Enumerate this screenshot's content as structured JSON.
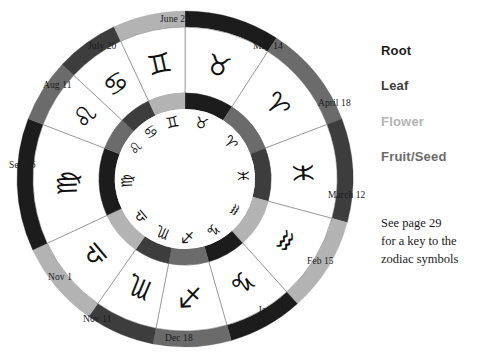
{
  "legend": {
    "items": [
      {
        "label": "Root",
        "color": "#1c1c1c"
      },
      {
        "label": "Leaf",
        "color": "#3d3d3d"
      },
      {
        "label": "Flower",
        "color": "#b3b3b3"
      },
      {
        "label": "Fruit/Seed",
        "color": "#6b6b6b"
      }
    ]
  },
  "note": {
    "line1": "See page 29",
    "line2": "for a key to the",
    "line3": "zodiac symbols"
  },
  "chart_data": {
    "type": "pie",
    "legend_position": "right",
    "grid": false,
    "categories": [
      "Taurus",
      "Aries",
      "Pisces",
      "Aquarius",
      "Capricorn",
      "Sagittarius",
      "Scorpio",
      "Libra",
      "Virgo",
      "Leo",
      "Cancer",
      "Gemini"
    ],
    "values": [
      33,
      36,
      36,
      33,
      26,
      27,
      24,
      30,
      46,
      22,
      22,
      29
    ],
    "segments": [
      {
        "sign": "Taurus",
        "symbol": "♉",
        "element": "Root",
        "color": "#1c1c1c",
        "start_date": "April 18",
        "end_date": "May 14",
        "a0": -90,
        "a1": -57
      },
      {
        "sign": "Aries",
        "symbol": "♈",
        "element": "Fruit/Seed",
        "color": "#6b6b6b",
        "start_date": "March 12",
        "end_date": "April 18",
        "a0": -57,
        "a1": -21
      },
      {
        "sign": "Pisces",
        "symbol": "♓",
        "element": "Leaf",
        "color": "#3d3d3d",
        "start_date": "Feb 15",
        "end_date": "March 12",
        "a0": -21,
        "a1": 15
      },
      {
        "sign": "Aquarius",
        "symbol": "♒",
        "element": "Flower",
        "color": "#b3b3b3",
        "start_date": "Jan 20",
        "end_date": "Feb 15",
        "a0": 15,
        "a1": 48
      },
      {
        "sign": "Capricorn",
        "symbol": "♑",
        "element": "Root",
        "color": "#1c1c1c",
        "start_date": "Dec 18",
        "end_date": "Jan 20",
        "a0": 48,
        "a1": 74
      },
      {
        "sign": "Sagittarius",
        "symbol": "♐",
        "element": "Fruit/Seed",
        "color": "#6b6b6b",
        "start_date": "Nov 11",
        "end_date": "Dec 18",
        "a0": 74,
        "a1": 101
      },
      {
        "sign": "Scorpio",
        "symbol": "♏",
        "element": "Leaf",
        "color": "#3d3d3d",
        "start_date": "Nov 1",
        "end_date": "Nov 11",
        "a0": 101,
        "a1": 125
      },
      {
        "sign": "Libra",
        "symbol": "♎",
        "element": "Flower",
        "color": "#b3b3b3",
        "start_date": "Sep 16",
        "end_date": "Nov 1",
        "a0": 125,
        "a1": 155
      },
      {
        "sign": "Virgo",
        "symbol": "♍",
        "element": "Root",
        "color": "#1c1c1c",
        "start_date": "Aug 11",
        "end_date": "Sep 16",
        "a0": 155,
        "a1": 201
      },
      {
        "sign": "Leo",
        "symbol": "♌",
        "element": "Fruit/Seed",
        "color": "#6b6b6b",
        "start_date": "July 20",
        "end_date": "Aug 11",
        "a0": 201,
        "a1": 223
      },
      {
        "sign": "Cancer",
        "symbol": "♋",
        "element": "Leaf",
        "color": "#3d3d3d",
        "start_date": "June 21",
        "end_date": "July 20",
        "a0": 223,
        "a1": 245
      },
      {
        "sign": "Gemini",
        "symbol": "♊",
        "element": "Flower",
        "color": "#b3b3b3",
        "start_date": "May 14",
        "end_date": "June 21",
        "a0": 245,
        "a1": 270
      }
    ],
    "date_labels": [
      {
        "text": "June 21",
        "x": 160,
        "y": 14
      },
      {
        "text": "May 14",
        "x": 253,
        "y": 41
      },
      {
        "text": "April 18",
        "x": 318,
        "y": 98
      },
      {
        "text": "March 12",
        "x": 328,
        "y": 190
      },
      {
        "text": "Feb 15",
        "x": 307,
        "y": 256
      },
      {
        "text": "Jan 20",
        "x": 258,
        "y": 305
      },
      {
        "text": "Dec 18",
        "x": 165,
        "y": 333
      },
      {
        "text": "Nov 11",
        "x": 83,
        "y": 314
      },
      {
        "text": "Nov 1",
        "x": 48,
        "y": 272
      },
      {
        "text": "Sep 16",
        "x": 9,
        "y": 160
      },
      {
        "text": "Aug 11",
        "x": 43,
        "y": 80
      },
      {
        "text": "July 20",
        "x": 88,
        "y": 41
      }
    ]
  }
}
